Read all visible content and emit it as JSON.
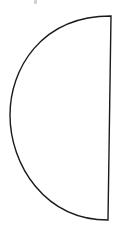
{
  "diagram": {
    "type": "semicircle",
    "stroke_color": "#1a1a1a",
    "fill_color": "#ffffff",
    "stroke_width": 1.4,
    "points": {
      "top_right": [
        111,
        16
      ],
      "bottom_right": [
        108,
        220
      ],
      "leftmost": [
        10,
        115
      ]
    },
    "path": "M111 16 C 40 16, 10 70, 10 115 C 10 165, 45 220, 108 220 Z",
    "faint_mark_color": "#cfcfcf"
  }
}
